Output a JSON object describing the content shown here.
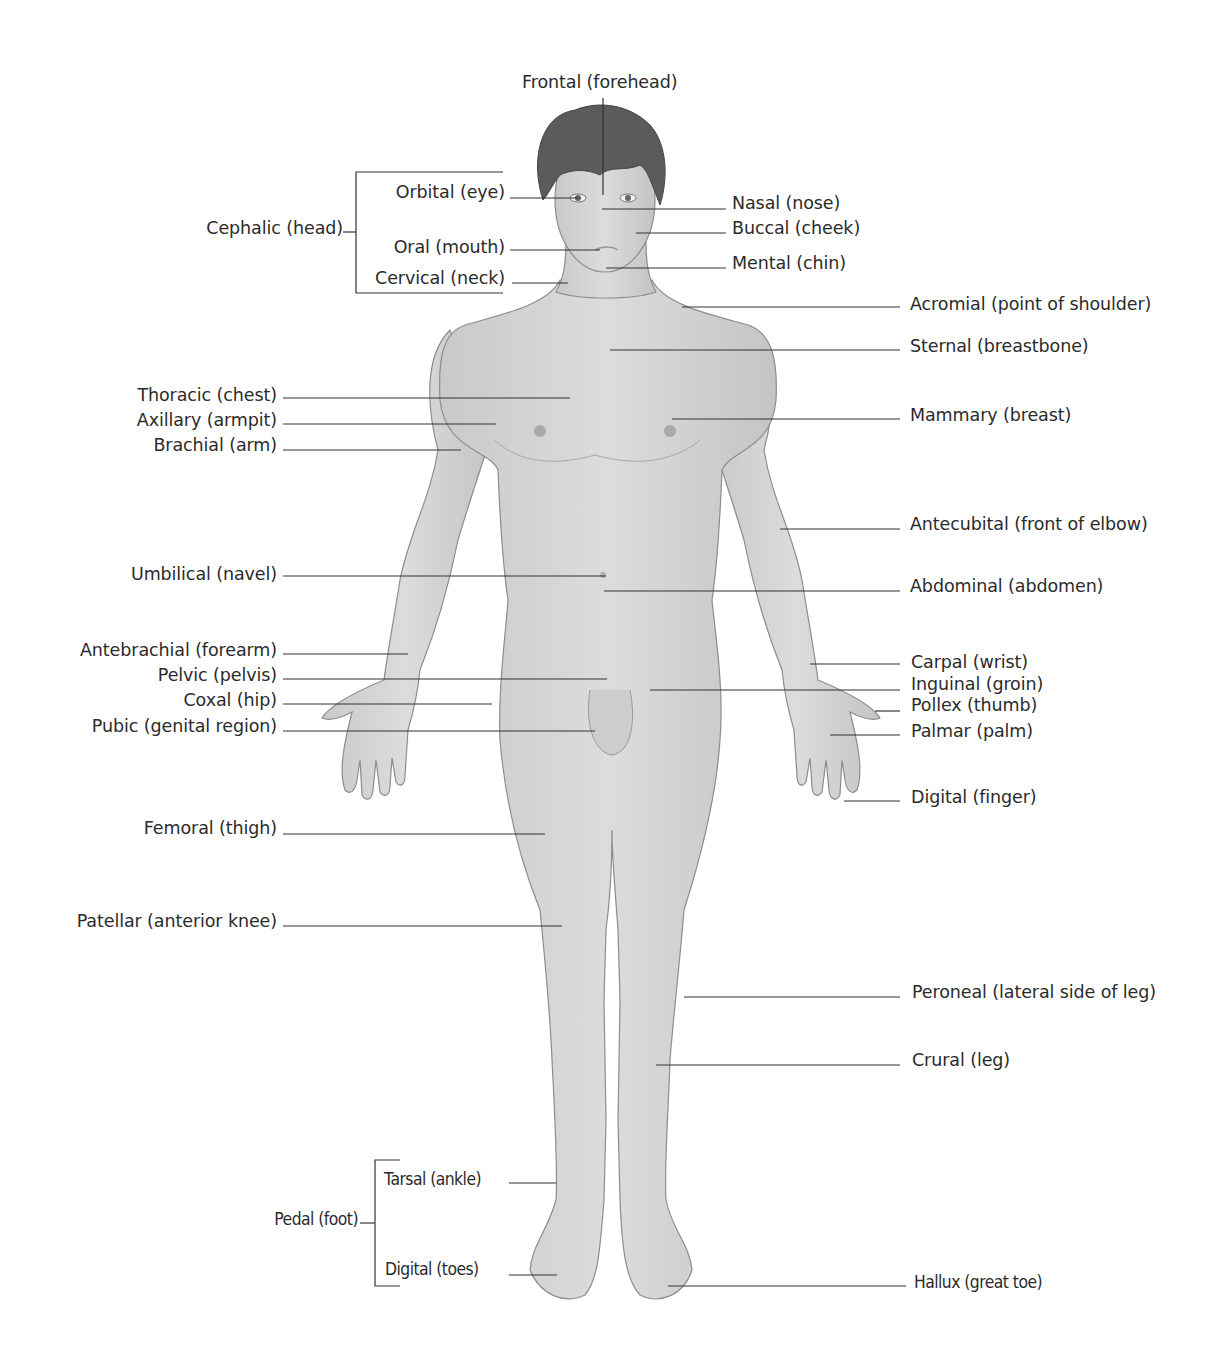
{
  "diagram": {
    "colors": {
      "skin": "#d6d6d6",
      "skin_outline": "#8a8a8a",
      "hair": "#5a5a5a",
      "leader_line": "#333333",
      "text": "#2b2b2b"
    }
  },
  "labels": {
    "frontal": "Frontal (forehead)",
    "cephalic": "Cephalic (head)",
    "orbital": "Orbital (eye)",
    "oral": "Oral (mouth)",
    "cervical": "Cervical (neck)",
    "nasal": "Nasal (nose)",
    "buccal": "Buccal (cheek)",
    "mental": "Mental (chin)",
    "acromial": "Acromial (point of shoulder)",
    "sternal": "Sternal (breastbone)",
    "thoracic": "Thoracic (chest)",
    "axillary": "Axillary (armpit)",
    "brachial": "Brachial (arm)",
    "mammary": "Mammary (breast)",
    "antecubital": "Antecubital (front of elbow)",
    "umbilical": "Umbilical (navel)",
    "abdominal": "Abdominal (abdomen)",
    "antebrachial": "Antebrachial (forearm)",
    "pelvic": "Pelvic (pelvis)",
    "coxal": "Coxal (hip)",
    "pubic": "Pubic (genital region)",
    "carpal": "Carpal (wrist)",
    "inguinal": "Inguinal (groin)",
    "pollex": "Pollex (thumb)",
    "palmar": "Palmar (palm)",
    "digital_finger": "Digital (finger)",
    "femoral": "Femoral (thigh)",
    "patellar": "Patellar (anterior knee)",
    "peroneal": "Peroneal (lateral side of leg)",
    "crural": "Crural (leg)",
    "pedal": "Pedal (foot)",
    "tarsal": "Tarsal (ankle)",
    "digital_toes": "Digital (toes)",
    "hallux": "Hallux (great toe)"
  }
}
